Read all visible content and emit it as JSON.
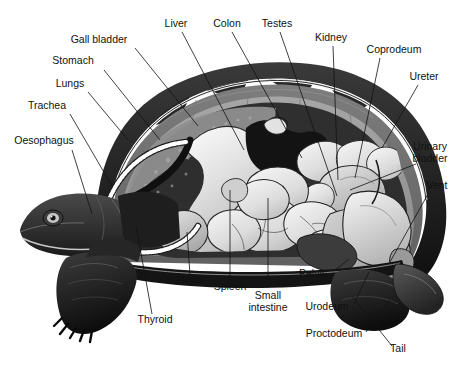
{
  "figure": {
    "caption": "",
    "width": 472,
    "height": 372,
    "background": "#ffffff"
  },
  "palette": {
    "background": "#ffffff",
    "ink": "#111111",
    "shell_rim_dark": "#1d1d1d",
    "shell_bone_mid": "#6f6f6f",
    "shell_bone_light": "#9a9a9a",
    "shell_keratin_line": "#f2f2f2",
    "cavity_dark": "#3a3a3a",
    "organ_light": "#d9d9d9",
    "organ_pale": "#eaeaea",
    "organ_mid": "#b4b4b4",
    "organ_dark": "#141414",
    "skin_dark": "#2a2a2a",
    "skin_mid": "#4a4a4a",
    "trachea_bead": "#ffffff"
  },
  "labels": [
    {
      "id": "gall-bladder",
      "text": "Gall bladder",
      "lines": [
        "Gall bladder"
      ],
      "x": 99,
      "y": 43,
      "anchor": "middle",
      "leader": [
        [
          135,
          48
        ],
        [
          198,
          126
        ]
      ]
    },
    {
      "id": "liver",
      "text": "Liver",
      "lines": [
        "Liver"
      ],
      "x": 176,
      "y": 27,
      "anchor": "middle",
      "leader": [
        [
          182,
          32
        ],
        [
          244,
          150
        ]
      ]
    },
    {
      "id": "colon",
      "text": "Colon",
      "lines": [
        "Colon"
      ],
      "x": 227,
      "y": 27,
      "anchor": "middle",
      "leader": [
        [
          232,
          32
        ],
        [
          302,
          158
        ]
      ]
    },
    {
      "id": "testes",
      "text": "Testes",
      "lines": [
        "Testes"
      ],
      "x": 277,
      "y": 27,
      "anchor": "middle",
      "leader": [
        [
          280,
          32
        ],
        [
          337,
          196
        ]
      ]
    },
    {
      "id": "kidney",
      "text": "Kidney",
      "lines": [
        "Kidney"
      ],
      "x": 331,
      "y": 41,
      "anchor": "middle",
      "leader": [
        [
          333,
          46
        ],
        [
          338,
          180
        ]
      ]
    },
    {
      "id": "coprodeum",
      "text": "Coprodeum",
      "lines": [
        "Coprodeum"
      ],
      "x": 394,
      "y": 53,
      "anchor": "middle",
      "leader": [
        [
          380,
          58
        ],
        [
          355,
          178
        ]
      ]
    },
    {
      "id": "ureter",
      "text": "Ureter",
      "lines": [
        "Ureter"
      ],
      "x": 424,
      "y": 80,
      "anchor": "middle",
      "leader": [
        [
          418,
          85
        ],
        [
          382,
          148
        ]
      ]
    },
    {
      "id": "urinary-bladder",
      "text": "Urinary bladder",
      "lines": [
        "Urinary",
        "bladder"
      ],
      "x": 430,
      "y": 150,
      "anchor": "middle",
      "leader": [
        [
          416,
          164
        ],
        [
          350,
          190
        ]
      ]
    },
    {
      "id": "vent",
      "text": "Vent",
      "lines": [
        "Vent"
      ],
      "x": 437,
      "y": 189,
      "anchor": "middle",
      "leader": [
        [
          428,
          194
        ],
        [
          390,
          262
        ]
      ]
    },
    {
      "id": "tail",
      "text": "Tail",
      "lines": [
        "Tail"
      ],
      "x": 398,
      "y": 352,
      "anchor": "middle",
      "leader": [
        [
          392,
          346
        ],
        [
          352,
          296
        ]
      ]
    },
    {
      "id": "proctodeum",
      "text": "Proctodeum",
      "lines": [
        "Proctodeum"
      ],
      "x": 334,
      "y": 337,
      "anchor": "middle",
      "leader": [
        [
          366,
          332
        ],
        [
          390,
          300
        ]
      ]
    },
    {
      "id": "urodeum",
      "text": "Urodeum",
      "lines": [
        "Urodeum"
      ],
      "x": 327,
      "y": 310,
      "anchor": "middle",
      "leader": [
        [
          354,
          304
        ],
        [
          369,
          272
        ]
      ]
    },
    {
      "id": "pelvis",
      "text": "Pelvis",
      "lines": [
        "Pelvis"
      ],
      "x": 313,
      "y": 277,
      "anchor": "middle",
      "leader": [
        [
          334,
          271
        ],
        [
          349,
          259
        ]
      ]
    },
    {
      "id": "small-intestine",
      "text": "Small intestine",
      "lines": [
        "Small",
        "intestine"
      ],
      "x": 268,
      "y": 299,
      "anchor": "middle",
      "leader": [
        [
          268,
          288
        ],
        [
          268,
          198
        ]
      ]
    },
    {
      "id": "spleen",
      "text": "Spleen",
      "lines": [
        "Spleen"
      ],
      "x": 230,
      "y": 290,
      "anchor": "middle",
      "leader": [
        [
          230,
          281
        ],
        [
          230,
          190
        ]
      ]
    },
    {
      "id": "heart",
      "text": "Heart",
      "lines": [
        "Heart"
      ],
      "x": 190,
      "y": 283,
      "anchor": "middle",
      "leader": [
        [
          190,
          275
        ],
        [
          187,
          232
        ]
      ]
    },
    {
      "id": "thyroid",
      "text": "Thyroid",
      "lines": [
        "Thyroid"
      ],
      "x": 155,
      "y": 323,
      "anchor": "middle",
      "leader": [
        [
          152,
          314
        ],
        [
          136,
          226
        ]
      ]
    },
    {
      "id": "oesophagus",
      "text": "Oesophagus",
      "lines": [
        "Oesophagus"
      ],
      "x": 44,
      "y": 144,
      "anchor": "middle",
      "leader": [
        [
          72,
          150
        ],
        [
          92,
          214
        ]
      ]
    },
    {
      "id": "trachea",
      "text": "Trachea",
      "lines": [
        "Trachea"
      ],
      "x": 47,
      "y": 109,
      "anchor": "middle",
      "leader": [
        [
          70,
          114
        ],
        [
          112,
          186
        ]
      ]
    },
    {
      "id": "lungs",
      "text": "Lungs",
      "lines": [
        "Lungs"
      ],
      "x": 70,
      "y": 87,
      "anchor": "middle",
      "leader": [
        [
          88,
          92
        ],
        [
          128,
          140
        ]
      ]
    },
    {
      "id": "stomach",
      "text": "Stomach",
      "lines": [
        "Stomach"
      ],
      "x": 73,
      "y": 64,
      "anchor": "middle",
      "leader": [
        [
          104,
          70
        ],
        [
          160,
          140
        ]
      ]
    }
  ],
  "anatomy_parts": [
    {
      "id": "carapace-rim",
      "name": "carapace-outer-rim",
      "tone": "shell_rim_dark"
    },
    {
      "id": "carapace-keratin",
      "name": "carapace-keratin-line",
      "tone": "shell_keratin_line"
    },
    {
      "id": "carapace-bone",
      "name": "carapace-bone-layer",
      "tone": "shell_bone_mid"
    },
    {
      "id": "carapace-inner",
      "name": "carapace-inner-surface",
      "tone": "shell_bone_light"
    },
    {
      "id": "body-cavity",
      "name": "body-cavity",
      "tone": "cavity_dark"
    },
    {
      "id": "lung-region",
      "name": "lung-region",
      "tone": "shell_bone_light"
    },
    {
      "id": "stomach",
      "name": "stomach-organ",
      "tone": "organ_light"
    },
    {
      "id": "liver",
      "name": "liver-organ",
      "tone": "organ_dark"
    },
    {
      "id": "gall-bladder",
      "name": "gall-bladder-organ",
      "tone": "organ_pale"
    },
    {
      "id": "intestines",
      "name": "intestine-mass",
      "tone": "organ_pale"
    },
    {
      "id": "colon",
      "name": "colon-organ",
      "tone": "organ_light"
    },
    {
      "id": "kidney",
      "name": "kidney-organ",
      "tone": "organ_light"
    },
    {
      "id": "bladder",
      "name": "urinary-bladder-organ",
      "tone": "organ_light"
    },
    {
      "id": "cloaca",
      "name": "cloaca-region",
      "tone": "organ_mid"
    },
    {
      "id": "heart",
      "name": "heart-organ",
      "tone": "organ_light"
    },
    {
      "id": "trachea",
      "name": "trachea-tube",
      "tone": "trachea_bead"
    },
    {
      "id": "head",
      "name": "head",
      "tone": "skin_dark"
    },
    {
      "id": "foreleg",
      "name": "front-leg",
      "tone": "skin_dark"
    },
    {
      "id": "hindleg",
      "name": "hind-leg",
      "tone": "skin_dark"
    },
    {
      "id": "tail",
      "name": "tail",
      "tone": "skin_mid"
    },
    {
      "id": "plastron",
      "name": "plastron",
      "tone": "shell_rim_dark"
    }
  ]
}
